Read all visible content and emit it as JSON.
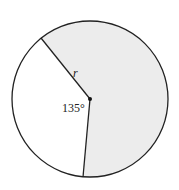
{
  "diagram": {
    "type": "circle-sector",
    "shaded_region": "major sector",
    "unshaded_angle_label": "135°",
    "radius_label": "r",
    "colors": {
      "shade": "#ececec",
      "stroke": "#222222",
      "background": "#ffffff"
    }
  }
}
